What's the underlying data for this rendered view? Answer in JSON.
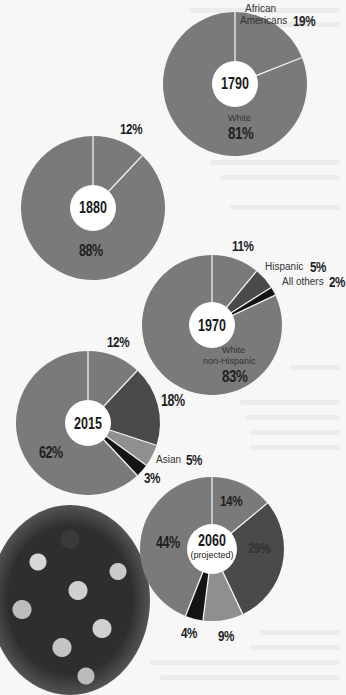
{
  "colors": {
    "main": "#7a7a7a",
    "dark": "#4a4a4a",
    "light": "#8f8f8f",
    "black": "#141414",
    "separator": "#f2f2f2",
    "hole": "#ffffff"
  },
  "chart_data": [
    {
      "type": "pie",
      "title": "1790",
      "categories": [
        "African Americans",
        "White"
      ],
      "values": [
        19,
        81
      ],
      "labels": [
        "African Americans 19%",
        "White 81%"
      ]
    },
    {
      "type": "pie",
      "title": "1880",
      "categories": [
        "Minority",
        "White"
      ],
      "values": [
        12,
        88
      ],
      "labels": [
        "12%",
        "88%"
      ]
    },
    {
      "type": "pie",
      "title": "1970",
      "categories": [
        "Black",
        "Hispanic",
        "All others",
        "White non-Hispanic"
      ],
      "values": [
        11,
        5,
        2,
        83
      ],
      "labels": [
        "11%",
        "Hispanic 5%",
        "All others 2%",
        "White non-Hispanic 83%"
      ]
    },
    {
      "type": "pie",
      "title": "2015",
      "categories": [
        "Black",
        "Hispanic",
        "Asian",
        "All others",
        "White non-Hispanic"
      ],
      "values": [
        12,
        18,
        5,
        3,
        62
      ],
      "labels": [
        "12%",
        "18%",
        "Asian 5%",
        "3%",
        "62%"
      ]
    },
    {
      "type": "pie",
      "title": "2060 (projected)",
      "categories": [
        "Black",
        "Hispanic",
        "Asian",
        "All others",
        "White non-Hispanic"
      ],
      "values": [
        14,
        29,
        9,
        4,
        44
      ],
      "labels": [
        "14%",
        "29%",
        "9%",
        "4%",
        "44%"
      ]
    }
  ],
  "donuts": [
    {
      "cx": 235,
      "cy": 84,
      "r": 72,
      "hole": 23,
      "segments": [
        {
          "value": 19,
          "color": "main"
        },
        {
          "value": 81,
          "color": "main"
        }
      ]
    },
    {
      "cx": 93,
      "cy": 208,
      "r": 72,
      "hole": 23,
      "segments": [
        {
          "value": 12,
          "color": "main"
        },
        {
          "value": 88,
          "color": "main"
        }
      ]
    },
    {
      "cx": 212,
      "cy": 325,
      "r": 70,
      "hole": 23,
      "segments": [
        {
          "value": 11,
          "color": "main"
        },
        {
          "value": 5,
          "color": "dark"
        },
        {
          "value": 2,
          "color": "black"
        },
        {
          "value": 82,
          "color": "main"
        }
      ]
    },
    {
      "cx": 88,
      "cy": 423,
      "r": 72,
      "hole": 23,
      "segments": [
        {
          "value": 12,
          "color": "main"
        },
        {
          "value": 18,
          "color": "dark"
        },
        {
          "value": 5,
          "color": "light"
        },
        {
          "value": 3,
          "color": "black"
        },
        {
          "value": 62,
          "color": "main"
        }
      ]
    },
    {
      "cx": 212,
      "cy": 549,
      "r": 72,
      "hole": 25,
      "segments": [
        {
          "value": 14,
          "color": "main"
        },
        {
          "value": 29,
          "color": "dark"
        },
        {
          "value": 9,
          "color": "light"
        },
        {
          "value": 4,
          "color": "black"
        },
        {
          "value": 44,
          "color": "main"
        }
      ]
    }
  ],
  "labels": {
    "c1790": {
      "year": "1790",
      "african_line1": "African",
      "african_line2": "Americans",
      "african_pct": "19%",
      "white": "White",
      "white_pct": "81%"
    },
    "c1880": {
      "year": "1880",
      "top_pct": "12%",
      "main_pct": "88%"
    },
    "c1970": {
      "year": "1970",
      "top_pct": "11%",
      "hispanic": "Hispanic",
      "hispanic_pct": "5%",
      "others": "All others",
      "others_pct": "2%",
      "white_line1": "White",
      "white_line2": "non-Hispanic",
      "white_pct": "83%"
    },
    "c2015": {
      "year": "2015",
      "top_pct": "12%",
      "dark_pct": "18%",
      "asian": "Asian",
      "asian_pct": "5%",
      "black_pct": "3%",
      "main_pct": "62%"
    },
    "c2060": {
      "year": "2060",
      "projected": "(projected)",
      "top_pct": "14%",
      "dark_pct": "29%",
      "light_pct": "9%",
      "black_pct": "4%",
      "main_pct": "44%"
    }
  }
}
